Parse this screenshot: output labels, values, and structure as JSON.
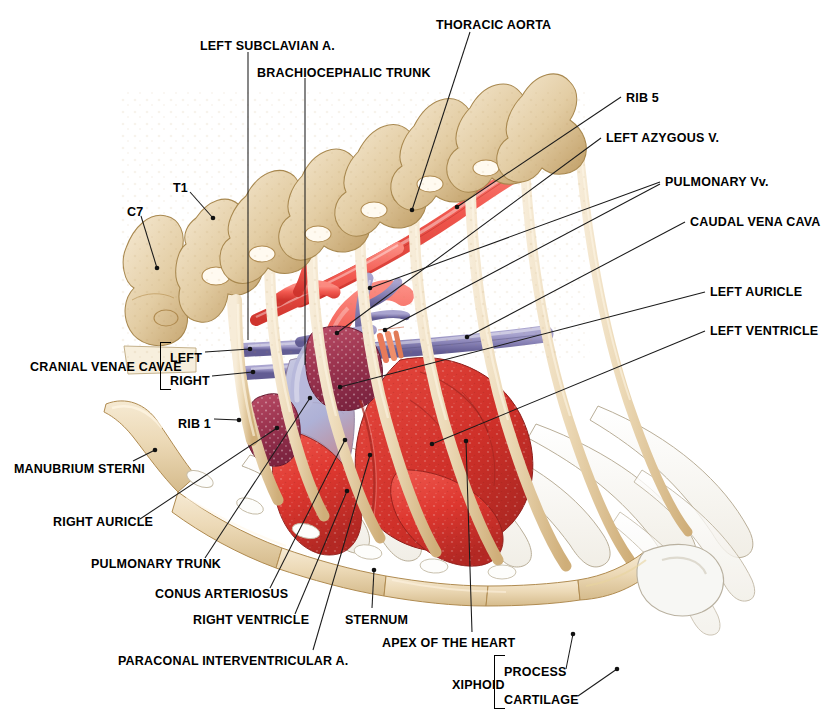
{
  "figure": {
    "background": "#ffffff",
    "palette": {
      "bone": "#e8d5b0",
      "bone_light": "#f4e6cc",
      "bone_shade": "#c9a86e",
      "bone_outline": "#a8884f",
      "cartilage": "#fbfaf7",
      "cartilage_outline": "#b9ae98",
      "artery_red": "#f05a52",
      "artery_red_dark": "#d63a32",
      "vein_purple": "#8b86b8",
      "vein_purple_dark": "#6a649c",
      "myocardium_red": "#e03a34",
      "myocardium_dark": "#b42a2a",
      "auricle_maroon": "#a83a55",
      "ventricle_blue": "#aab0d4",
      "leader": "#1a1a1a",
      "text": "#000000"
    }
  },
  "labels": {
    "left_subclavian": "LEFT SUBCLAVIAN A.",
    "brachiocephalic_trunk": "BRACHIOCEPHALIC TRUNK",
    "thoracic_aorta": "THORACIC AORTA",
    "rib5": "RIB 5",
    "left_azygous": "LEFT AZYGOUS V.",
    "pulmonary_vv": "PULMONARY Vv.",
    "caudal_vena_cava": "CAUDAL VENA CAVA",
    "left_auricle": "LEFT AURICLE",
    "left_ventricle": "LEFT VENTRICLE",
    "t1": "T1",
    "c7": "C7",
    "cranial_venae_cavae": "CRANIAL VENAE CAVAE",
    "cvc_left": "LEFT",
    "cvc_right": "RIGHT",
    "rib1": "RIB 1",
    "manubrium_sterni": "MANUBRIUM STERNI",
    "right_auricle": "RIGHT AURICLE",
    "pulmonary_trunk": "PULMONARY TRUNK",
    "conus_arteriosus": "CONUS ARTERIOSUS",
    "right_ventricle": "RIGHT VENTRICLE",
    "sternum": "STERNUM",
    "paraconal": "PARACONAL INTERVENTRICULAR A.",
    "apex_of_the_heart": "APEX OF THE HEART",
    "xiphoid": "XIPHOID",
    "xiphoid_process": "PROCESS",
    "xiphoid_cartilage": "CARTILAGE"
  },
  "label_positions": {
    "left_subclavian": {
      "x": 200,
      "y": 40
    },
    "brachiocephalic_trunk": {
      "x": 257,
      "y": 67
    },
    "thoracic_aorta": {
      "x": 436,
      "y": 19
    },
    "rib5": {
      "x": 626,
      "y": 92
    },
    "left_azygous": {
      "x": 606,
      "y": 132
    },
    "pulmonary_vv": {
      "x": 665,
      "y": 176
    },
    "caudal_vena_cava": {
      "x": 690,
      "y": 216
    },
    "left_auricle": {
      "x": 710,
      "y": 286
    },
    "left_ventricle": {
      "x": 710,
      "y": 325
    },
    "t1": {
      "x": 173,
      "y": 182
    },
    "c7": {
      "x": 127,
      "y": 206
    },
    "cranial_venae_cavae": {
      "x": 30,
      "y": 361
    },
    "cvc_left": {
      "x": 170,
      "y": 352
    },
    "cvc_right": {
      "x": 170,
      "y": 375
    },
    "rib1": {
      "x": 178,
      "y": 418
    },
    "manubrium_sterni": {
      "x": 14,
      "y": 463
    },
    "right_auricle": {
      "x": 53,
      "y": 516
    },
    "pulmonary_trunk": {
      "x": 91,
      "y": 558
    },
    "conus_arteriosus": {
      "x": 155,
      "y": 588
    },
    "right_ventricle": {
      "x": 193,
      "y": 614
    },
    "sternum": {
      "x": 345,
      "y": 614
    },
    "paraconal": {
      "x": 118,
      "y": 655
    },
    "apex_of_the_heart": {
      "x": 382,
      "y": 637
    },
    "xiphoid": {
      "x": 452,
      "y": 679
    },
    "xiphoid_process": {
      "x": 504,
      "y": 666
    },
    "xiphoid_cartilage": {
      "x": 504,
      "y": 694
    }
  },
  "leaders": [
    {
      "name": "left-subclavian",
      "path": "M248,52 L248,340",
      "dot": null
    },
    {
      "name": "brachiocephalic-trunk",
      "path": "M305,78 L305,365",
      "dot": null
    },
    {
      "name": "thoracic-aorta",
      "path": "M470,32 L412,210",
      "dot": [
        412,
        210
      ]
    },
    {
      "name": "rib5",
      "path": "M621,97 L457,207",
      "dot": [
        457,
        207
      ]
    },
    {
      "name": "left-azygous",
      "path": "M601,138 L337,333",
      "dot": [
        337,
        333
      ]
    },
    {
      "name": "pulmonary-vv-a",
      "path": "M660,182 L370,288",
      "dot": [
        370,
        288
      ]
    },
    {
      "name": "pulmonary-vv-b",
      "path": "M660,184 L385,330",
      "dot": [
        385,
        330
      ]
    },
    {
      "name": "caudal-vena-cava",
      "path": "M685,222 L467,337",
      "dot": [
        467,
        337
      ]
    },
    {
      "name": "left-auricle",
      "path": "M705,292 L340,387",
      "dot": [
        340,
        387
      ]
    },
    {
      "name": "left-ventricle",
      "path": "M705,331 L432,444",
      "dot": [
        432,
        444
      ]
    },
    {
      "name": "t1",
      "path": "M190,192 L213,218",
      "dot": [
        213,
        218
      ]
    },
    {
      "name": "c7",
      "path": "M141,216 L157,268",
      "dot": [
        157,
        268
      ]
    },
    {
      "name": "cvc-left",
      "path": "M205,352 L250,349",
      "dot": [
        250,
        349
      ]
    },
    {
      "name": "cvc-right",
      "path": "M212,376 L253,372",
      "dot": [
        253,
        372
      ]
    },
    {
      "name": "rib1",
      "path": "M214,419 L239,420",
      "dot": [
        239,
        420
      ]
    },
    {
      "name": "manubrium-sterni",
      "path": "M133,461 L155,450",
      "dot": [
        155,
        450
      ]
    },
    {
      "name": "right-auricle",
      "path": "M140,519 L277,428",
      "dot": [
        277,
        428
      ]
    },
    {
      "name": "pulmonary-trunk",
      "path": "M205,558 L310,398",
      "dot": [
        310,
        398
      ]
    },
    {
      "name": "conus-arteriosus",
      "path": "M270,588 L345,440",
      "dot": [
        345,
        440
      ]
    },
    {
      "name": "right-ventricle",
      "path": "M295,614 L347,491",
      "dot": [
        347,
        491
      ]
    },
    {
      "name": "sternum",
      "path": "M372,608 L374,570",
      "dot": [
        374,
        570
      ]
    },
    {
      "name": "paraconal",
      "path": "M313,650 L370,455",
      "dot": [
        370,
        455
      ]
    },
    {
      "name": "apex-of-the-heart",
      "path": "M472,632 L466,441",
      "dot": [
        466,
        441
      ]
    },
    {
      "name": "xiphoid-process",
      "path": "M566,669 L573,634",
      "dot": [
        573,
        634
      ]
    },
    {
      "name": "xiphoid-cartilage",
      "path": "M578,696 L617,669",
      "dot": [
        617,
        669
      ]
    }
  ],
  "brackets": [
    {
      "name": "cranial-venae-cavae-bracket",
      "x": 160,
      "y": 342,
      "w": 10,
      "h": 46
    },
    {
      "name": "xiphoid-bracket",
      "x": 494,
      "y": 655,
      "w": 10,
      "h": 52
    }
  ]
}
